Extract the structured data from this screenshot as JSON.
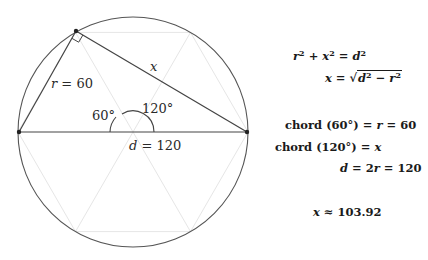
{
  "diagram": {
    "circle": {
      "cx": 133,
      "cy": 132,
      "r": 115,
      "stroke": "#555555"
    },
    "points": {
      "left": [
        19,
        132
      ],
      "right": [
        247,
        132
      ],
      "top": [
        76,
        31
      ]
    },
    "labels": {
      "r_label_var": "r",
      "r_label_rest": " = 60",
      "x_label": "x",
      "angle_60": "60°",
      "angle_120": "120°",
      "d_label_var": "d",
      "d_label_rest": " = 120"
    },
    "guide_color": "#e4e4e4",
    "line_color": "#444444"
  },
  "equations": {
    "eq1": {
      "a": "r",
      "b": "x",
      "c": "d"
    },
    "eq2": {
      "lhs": "x",
      "rad_a": "d",
      "rad_b": "r"
    },
    "eq3": {
      "text": "chord (60°) = ",
      "var": "r",
      "tail": " = 60"
    },
    "eq4": {
      "text": "chord (120°) = ",
      "var": "x"
    },
    "eq5": {
      "var1": "d",
      "mid": " = 2",
      "var2": "r",
      "tail": " = 120"
    },
    "eq6": {
      "var": "x",
      "tail": " ≈ 103.92"
    }
  }
}
